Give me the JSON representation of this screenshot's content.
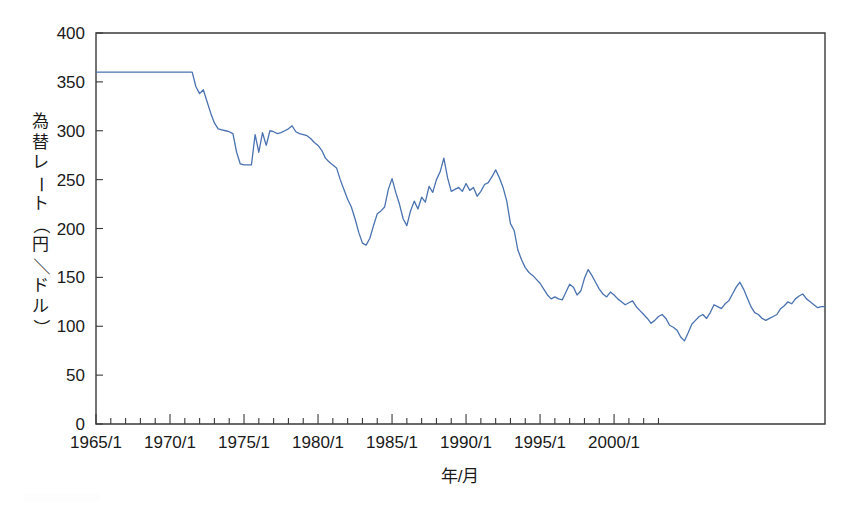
{
  "figure": {
    "background_color": "#ffffff",
    "line_color": "#4a72b0",
    "axis_color": "#3a3a3a"
  },
  "axes": {
    "y_title_chars": [
      "為",
      "替",
      "レ",
      "ー",
      "ト",
      "（",
      "円",
      "／",
      "ド",
      "ル",
      "）"
    ],
    "y_title_text": "為替レート（円／ドル）",
    "x_title_text": "年/月",
    "y_ticks": [
      "0",
      "50",
      "100",
      "150",
      "200",
      "250",
      "300",
      "350",
      "400"
    ],
    "x_ticks": [
      "1965/1",
      "1970/1",
      "1975/1",
      "1980/1",
      "1985/1",
      "1990/1",
      "1995/1",
      "2000/1"
    ]
  },
  "chart_data": {
    "type": "line",
    "title": "",
    "subtitle": "",
    "xlabel": "年/月",
    "ylabel": "為替レート（円／ドル）",
    "xlim": [
      "1965/1",
      "2003/7"
    ],
    "ylim": [
      0,
      400
    ],
    "y_ticks": [
      0,
      50,
      100,
      150,
      200,
      250,
      300,
      350,
      400
    ],
    "x_ticks": [
      "1965/1",
      "1970/1",
      "1975/1",
      "1980/1",
      "1985/1",
      "1990/1",
      "1995/1",
      "2000/1"
    ],
    "x_minor_tick_interval_years": 1,
    "grid": false,
    "legend": null,
    "legend_position": "none",
    "series": [
      {
        "name": "為替レート（円／ドル）",
        "color": "#4a72b0",
        "x_start": "1965/1",
        "x_step_months": 3,
        "values": [
          360,
          360,
          360,
          360,
          360,
          360,
          360,
          360,
          360,
          360,
          360,
          360,
          360,
          360,
          360,
          360,
          360,
          360,
          360,
          360,
          360,
          360,
          360,
          360,
          360,
          360,
          360,
          345,
          338,
          342,
          330,
          318,
          308,
          302,
          301,
          300,
          299,
          297,
          278,
          266,
          265,
          265,
          265,
          296,
          278,
          298,
          285,
          300,
          299,
          297,
          298,
          300,
          302,
          305,
          299,
          297,
          296,
          295,
          292,
          288,
          285,
          280,
          272,
          268,
          265,
          262,
          250,
          240,
          230,
          222,
          210,
          196,
          185,
          183,
          190,
          203,
          215,
          218,
          222,
          240,
          251,
          237,
          225,
          210,
          203,
          218,
          228,
          220,
          232,
          227,
          243,
          237,
          250,
          258,
          272,
          252,
          238,
          240,
          242,
          238,
          246,
          239,
          242,
          233,
          238,
          245,
          247,
          253,
          260,
          252,
          242,
          228,
          205,
          198,
          178,
          168,
          160,
          155,
          152,
          148,
          144,
          138,
          132,
          128,
          130,
          128,
          127,
          135,
          143,
          140,
          132,
          136,
          149,
          158,
          152,
          145,
          138,
          133,
          130,
          135,
          132,
          128,
          125,
          122,
          124,
          126,
          120,
          116,
          112,
          108,
          103,
          106,
          110,
          112,
          108,
          101,
          99,
          96,
          89,
          85,
          93,
          102,
          106,
          110,
          112,
          108,
          114,
          122,
          120,
          118,
          123,
          126,
          133,
          140,
          145,
          138,
          129,
          120,
          114,
          112,
          108,
          106,
          108,
          110,
          112,
          118,
          121,
          125,
          123,
          128,
          131,
          133,
          128,
          125,
          122,
          119,
          120,
          120
        ],
        "key_points": [
          {
            "label": "ブレトンウッズ固定相場",
            "x": "1965/1-1971/8",
            "value": 360
          },
          {
            "label": "ニクソン・ショック後",
            "x": "1973/1",
            "value": 265
          },
          {
            "label": "1978年底",
            "x": "1978/10",
            "value": 183
          },
          {
            "label": "1982年高値",
            "x": "1982/11",
            "value": 272
          },
          {
            "label": "プラザ合意前",
            "x": "1985/2",
            "value": 260
          },
          {
            "label": "1990年戻り高値",
            "x": "1990/4",
            "value": 158
          },
          {
            "label": "1995年最安値",
            "x": "1995/4",
            "value": 85
          },
          {
            "label": "1998年高値",
            "x": "1998/8",
            "value": 145
          },
          {
            "label": "終値",
            "x": "2003/7",
            "value": 120
          }
        ]
      }
    ]
  }
}
